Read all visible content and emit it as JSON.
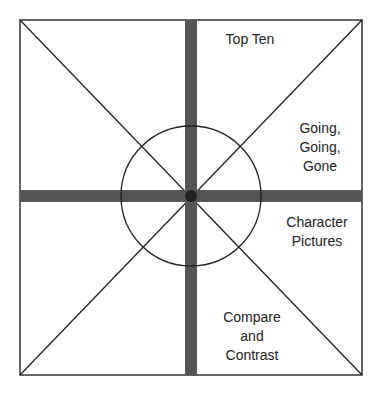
{
  "diagram": {
    "type": "graphic organizer",
    "colors": {
      "bar": "#555555",
      "line": "#222222",
      "background": "#ffffff"
    },
    "labels": {
      "top": "Top Ten",
      "upper_right": [
        "Going,",
        "Going,",
        "Gone"
      ],
      "lower_right": [
        "Character",
        "Pictures"
      ],
      "bottom": [
        "Compare",
        "and",
        "Contrast"
      ]
    }
  }
}
